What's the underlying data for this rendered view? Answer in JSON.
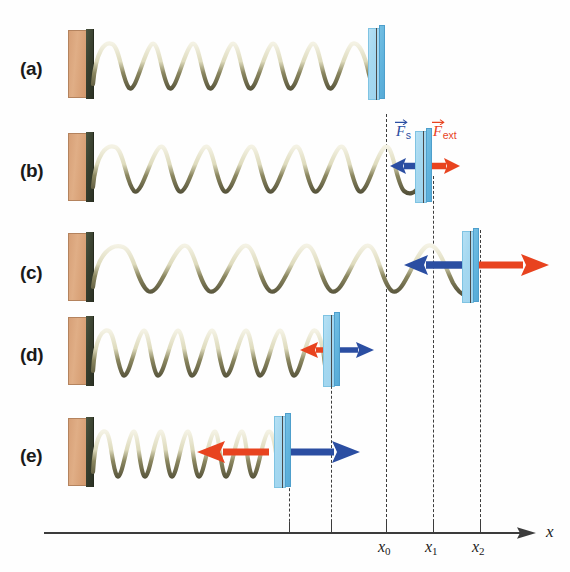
{
  "figure": {
    "colors": {
      "spring_force": "#2b4ea2",
      "external_force": "#e8431f",
      "block": "#a5d8f0",
      "wall_brick": "#d7a077",
      "wall_face": "#39402f",
      "guide_line": "#3c3c3c",
      "axis": "#3c3c3c"
    }
  },
  "panels": [
    {
      "label": "(a)",
      "state": "relaxed",
      "block_x": 370,
      "spring_coils": 14,
      "arrows": []
    },
    {
      "label": "(b)",
      "state": "stretched-small",
      "block_x": 417,
      "spring_coils": 14,
      "arrows": [
        {
          "name": "spring-force",
          "direction": "left",
          "color": "#2b4ea2",
          "length": 30
        },
        {
          "name": "external-force",
          "direction": "right",
          "color": "#e8431f",
          "length": 30
        }
      ]
    },
    {
      "label": "(c)",
      "state": "stretched-large",
      "block_x": 464,
      "spring_coils": 10,
      "arrows": [
        {
          "name": "spring-force",
          "direction": "left",
          "color": "#2b4ea2",
          "length": 74
        },
        {
          "name": "external-force",
          "direction": "right",
          "color": "#e8431f",
          "length": 74
        }
      ]
    },
    {
      "label": "(d)",
      "state": "compressed-small",
      "block_x": 325,
      "spring_coils": 17,
      "arrows": [
        {
          "name": "spring-force",
          "direction": "right",
          "color": "#2b4ea2",
          "length": 32
        },
        {
          "name": "external-force",
          "direction": "left",
          "color": "#e8431f",
          "length": 24
        }
      ]
    },
    {
      "label": "(e)",
      "state": "compressed-large",
      "block_x": 276,
      "spring_coils": 19,
      "arrows": [
        {
          "name": "spring-force",
          "direction": "right",
          "color": "#2b4ea2",
          "length": 70
        },
        {
          "name": "external-force",
          "direction": "left",
          "color": "#e8431f",
          "length": 70
        }
      ]
    }
  ],
  "force_labels": {
    "spring": {
      "symbol": "F",
      "subscript": "s",
      "color": "#2b4ea2"
    },
    "external": {
      "symbol": "F",
      "subscript": "ext",
      "color": "#e8431f"
    }
  },
  "axis": {
    "name": "x",
    "ticks": [
      {
        "label": "x",
        "subscript": "0",
        "x": 386
      },
      {
        "label": "x",
        "subscript": "1",
        "x": 433
      },
      {
        "label": "x",
        "subscript": "2",
        "x": 480
      }
    ],
    "unlabeled_guides": [
      289,
      331
    ]
  }
}
